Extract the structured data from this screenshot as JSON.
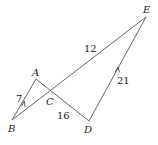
{
  "diagram": {
    "points": {
      "A": {
        "label": "A",
        "x": 36,
        "y": 79
      },
      "B": {
        "label": "B",
        "x": 12,
        "y": 120
      },
      "C": {
        "label": "C",
        "x": 51,
        "y": 91
      },
      "D": {
        "label": "D",
        "x": 89,
        "y": 121
      },
      "E": {
        "label": "E",
        "x": 146,
        "y": 17
      }
    },
    "segments": [
      {
        "from": "B",
        "to": "A",
        "length_label": "7",
        "parallel_mark": true
      },
      {
        "from": "A",
        "to": "D",
        "length_label": "16"
      },
      {
        "from": "B",
        "to": "E",
        "length_label": "12"
      },
      {
        "from": "D",
        "to": "E",
        "length_label": "21",
        "parallel_mark": true
      }
    ],
    "labels": {
      "ab": "7",
      "cd": "16",
      "ce": "12",
      "de": "21"
    },
    "point_labels": {
      "A": "A",
      "B": "B",
      "C": "C",
      "D": "D",
      "E": "E"
    }
  }
}
